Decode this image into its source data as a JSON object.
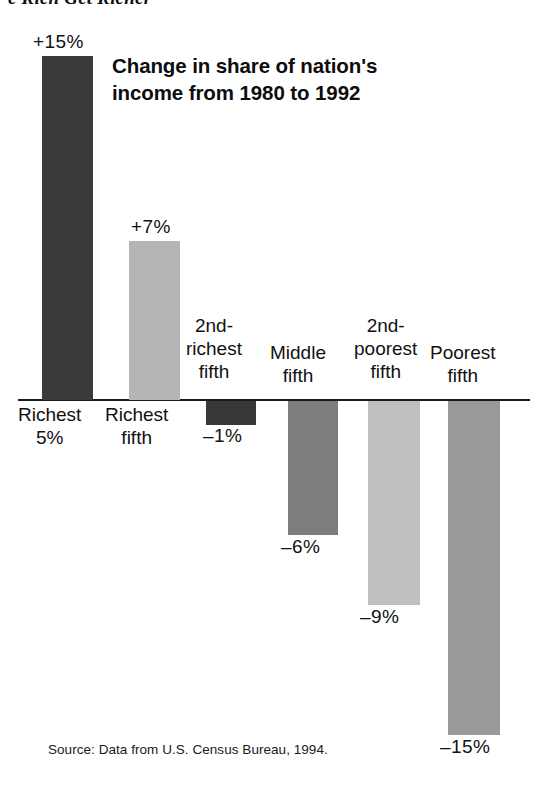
{
  "figure": {
    "heading": "e Rich Get Richer",
    "heading_full": "The Rich Get Richer"
  },
  "chart_data": {
    "type": "bar",
    "title": "Change in share of nation's income from 1980 to 1992",
    "title_line1": "Change in share of nation's",
    "title_line2": "income from 1980 to 1992",
    "xlabel": "",
    "ylabel": "",
    "ylim": [
      -15,
      15
    ],
    "grid": false,
    "legend": "none",
    "unit": "%",
    "source": "Source: Data from U.S. Census Bureau, 1994.",
    "categories": [
      "Richest 5%",
      "Richest fifth",
      "2nd-richest fifth",
      "Middle fifth",
      "2nd-poorest fifth",
      "Poorest fifth"
    ],
    "values": [
      15,
      7,
      -1,
      -6,
      -9,
      -15
    ],
    "value_labels": [
      "+15%",
      "+7%",
      "–1%",
      "–6%",
      "–9%",
      "–15%"
    ],
    "colors": [
      "#3a3a3a",
      "#b5b5b5",
      "#383838",
      "#7d7d7d",
      "#bfbfbf",
      "#999999"
    ],
    "bars": [
      {
        "category": "Richest 5%",
        "label_lines": [
          "Richest",
          "5%"
        ],
        "value": 15,
        "value_label": "+15%",
        "color": "#3a3a3a",
        "x": 42,
        "w": 51,
        "top": 56,
        "h": 344,
        "label_left": 18,
        "label_top": 403,
        "value_left": 33,
        "value_top": 31
      },
      {
        "category": "Richest fifth",
        "label_lines": [
          "Richest",
          "fifth"
        ],
        "value": 7,
        "value_label": "+7%",
        "color": "#b5b5b5",
        "x": 129,
        "w": 51,
        "top": 241,
        "h": 159,
        "label_left": 105,
        "label_top": 403,
        "value_left": 131,
        "value_top": 216
      },
      {
        "category": "2nd-richest fifth",
        "label_lines": [
          "2nd-",
          "richest",
          "fifth"
        ],
        "value": -1,
        "value_label": "–1%",
        "color": "#383838",
        "x": 206,
        "w": 50,
        "top": 401,
        "h": 24,
        "label_left": 186,
        "label_top": 314,
        "value_left": 203,
        "value_top": 425
      },
      {
        "category": "Middle fifth",
        "label_lines": [
          "Middle",
          "fifth"
        ],
        "value": -6,
        "value_label": "–6%",
        "color": "#7d7d7d",
        "x": 288,
        "w": 50,
        "top": 401,
        "h": 134,
        "label_left": 270,
        "label_top": 341,
        "value_left": 281,
        "value_top": 536
      },
      {
        "category": "2nd-poorest fifth",
        "label_lines": [
          "2nd-",
          "poorest",
          "fifth"
        ],
        "value": -9,
        "value_label": "–9%",
        "color": "#bfbfbf",
        "x": 368,
        "w": 52,
        "top": 401,
        "h": 204,
        "label_left": 354,
        "label_top": 314,
        "value_left": 360,
        "value_top": 606
      },
      {
        "category": "Poorest fifth",
        "label_lines": [
          "Poorest",
          "fifth"
        ],
        "value": -15,
        "value_label": "–15%",
        "color": "#999999",
        "x": 448,
        "w": 52,
        "top": 401,
        "h": 334,
        "label_left": 430,
        "label_top": 341,
        "value_left": 440,
        "value_top": 736
      }
    ]
  }
}
